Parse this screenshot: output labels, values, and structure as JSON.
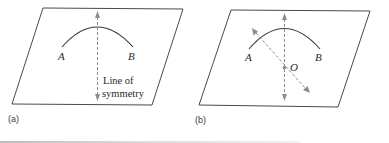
{
  "figure": {
    "panels": [
      {
        "id": "a",
        "label": "(a)",
        "points": {
          "A": "A",
          "B": "B"
        },
        "annotation_line1": "Line of",
        "annotation_line2": "symmetry"
      },
      {
        "id": "b",
        "label": "(b)",
        "points": {
          "A": "A",
          "B": "B",
          "O": "O"
        }
      }
    ],
    "colors": {
      "plane_stroke": "#4a4a4a",
      "arc_stroke": "#3a3a3a",
      "dashed_axis": "#8c8c8c",
      "text": "#2a2a2a"
    }
  }
}
